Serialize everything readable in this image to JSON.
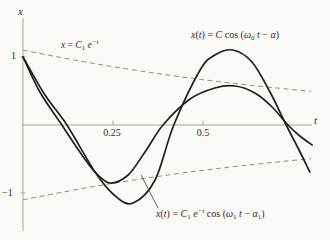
{
  "figure": {
    "background": "#fbfaf7",
    "curve_color": "#211f1c",
    "envelope_color": "#938e85",
    "axis_color": "#a8a49d",
    "text_color": "#2c2a27"
  },
  "chart_data": {
    "type": "line",
    "title": "",
    "xlabel": "t",
    "ylabel": "x",
    "xlim": [
      0,
      0.803
    ],
    "ylim": [
      -1.56,
      1.57
    ],
    "xticks": [
      0.25,
      0.5
    ],
    "yticks": [
      1,
      -1
    ],
    "xtick_labels": [
      "0.25",
      "0.5"
    ],
    "ytick_labels": [
      "1",
      "−1"
    ],
    "grid": false,
    "legend": "none",
    "series": [
      {
        "name": "upper-envelope x = C1 e^-t",
        "style": "dashed",
        "points": [
          [
            0,
            1.1
          ],
          [
            0.2,
            0.901
          ],
          [
            0.408,
            0.731
          ],
          [
            0.603,
            0.602
          ],
          [
            0.8,
            0.494
          ]
        ]
      },
      {
        "name": "lower-envelope x = -C1 e^-t",
        "style": "dashed",
        "points": [
          [
            0,
            -1.1
          ],
          [
            0.2,
            -0.901
          ],
          [
            0.408,
            -0.731
          ],
          [
            0.603,
            -0.602
          ],
          [
            0.8,
            -0.494
          ]
        ]
      },
      {
        "name": "undamped x(t) = C cos(w0 t - a)",
        "style": "solid",
        "points": [
          [
            0,
            1.0
          ],
          [
            0.061,
            0.441
          ],
          [
            0.122,
            0
          ],
          [
            0.2,
            -0.691
          ],
          [
            0.256,
            -1.044
          ],
          [
            0.306,
            -1.147
          ],
          [
            0.367,
            -0.809
          ],
          [
            0.419,
            0
          ],
          [
            0.492,
            0.809
          ],
          [
            0.533,
            1.029
          ],
          [
            0.583,
            1.103
          ],
          [
            0.636,
            0.926
          ],
          [
            0.686,
            0.485
          ],
          [
            0.731,
            0
          ],
          [
            0.764,
            -0.338
          ],
          [
            0.797,
            -0.691
          ]
        ]
      },
      {
        "name": "damped x(t) = C1 e^-t cos(w1 t - a1)",
        "style": "solid",
        "points": [
          [
            0,
            1.0
          ],
          [
            0.047,
            0.485
          ],
          [
            0.108,
            0
          ],
          [
            0.158,
            -0.397
          ],
          [
            0.2,
            -0.691
          ],
          [
            0.242,
            -0.853
          ],
          [
            0.292,
            -0.735
          ],
          [
            0.339,
            -0.397
          ],
          [
            0.389,
            0
          ],
          [
            0.464,
            0.382
          ],
          [
            0.533,
            0.544
          ],
          [
            0.589,
            0.574
          ],
          [
            0.644,
            0.471
          ],
          [
            0.692,
            0.265
          ],
          [
            0.736,
            0
          ],
          [
            0.769,
            -0.162
          ],
          [
            0.803,
            -0.294
          ]
        ]
      }
    ],
    "annotations": {
      "leader_line": {
        "from": [
          0.328,
          -0.735
        ],
        "to": [
          0.375,
          -1.221
        ]
      }
    }
  },
  "labels": {
    "x_axis_name": "x",
    "t_axis_name": "t",
    "tick_one": "1",
    "tick_neg_one": "−1",
    "tick_025": "0.25",
    "tick_05": "0.5",
    "envelope_eq": {
      "segments": [
        {
          "t": "x",
          "s": "i"
        },
        {
          "t": " = ",
          "s": "r"
        },
        {
          "t": "C",
          "s": "i"
        },
        {
          "t": "1",
          "s": "sub"
        },
        {
          "t": " ",
          "s": "r"
        },
        {
          "t": "e",
          "s": "i"
        },
        {
          "t": "−t",
          "s": "supi"
        }
      ]
    },
    "undamped_eq": {
      "segments": [
        {
          "t": "x",
          "s": "i"
        },
        {
          "t": "(",
          "s": "r"
        },
        {
          "t": "t",
          "s": "i"
        },
        {
          "t": ") = ",
          "s": "r"
        },
        {
          "t": "C",
          "s": "i"
        },
        {
          "t": " cos (",
          "s": "r"
        },
        {
          "t": "ω",
          "s": "i"
        },
        {
          "t": "0",
          "s": "sub"
        },
        {
          "t": " ",
          "s": "r"
        },
        {
          "t": "t",
          "s": "i"
        },
        {
          "t": " − ",
          "s": "r"
        },
        {
          "t": "α",
          "s": "i"
        },
        {
          "t": ")",
          "s": "r"
        }
      ]
    },
    "damped_eq": {
      "segments": [
        {
          "t": "x",
          "s": "i"
        },
        {
          "t": "(",
          "s": "r"
        },
        {
          "t": "t",
          "s": "i"
        },
        {
          "t": ") = ",
          "s": "r"
        },
        {
          "t": "C",
          "s": "i"
        },
        {
          "t": "1",
          "s": "sub"
        },
        {
          "t": " ",
          "s": "r"
        },
        {
          "t": "e",
          "s": "i"
        },
        {
          "t": "−t",
          "s": "supi"
        },
        {
          "t": " cos (",
          "s": "r"
        },
        {
          "t": "ω",
          "s": "i"
        },
        {
          "t": "1",
          "s": "sub"
        },
        {
          "t": " ",
          "s": "r"
        },
        {
          "t": "t",
          "s": "i"
        },
        {
          "t": " − ",
          "s": "r"
        },
        {
          "t": "α",
          "s": "i"
        },
        {
          "t": "1",
          "s": "sub"
        },
        {
          "t": ")",
          "s": "r"
        }
      ]
    }
  }
}
